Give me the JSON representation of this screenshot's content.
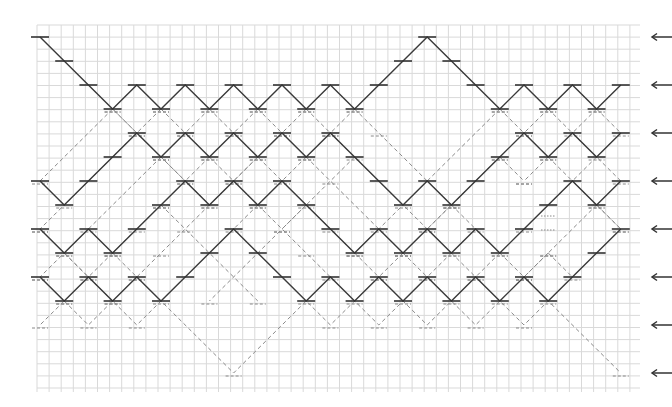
{
  "diagram": {
    "title": "",
    "grid": {
      "x0": 37,
      "y0": 25,
      "x1": 640,
      "y1": 392,
      "cell": 12.1,
      "color": "#d9d9d9"
    },
    "lattice": {
      "col0_x": 40,
      "col_step": 24.2,
      "cols": 25,
      "row0_y": 37,
      "row_step": 24.0,
      "rows": 15
    },
    "colors": {
      "solid": "#3a3a3a",
      "dashed": "#8a8a8a",
      "arrow": "#333333",
      "background": "#ffffff"
    },
    "solid_paths": [
      {
        "name": "path-1",
        "points": [
          [
            0,
            0
          ],
          [
            1,
            1
          ],
          [
            2,
            2
          ],
          [
            3,
            3
          ],
          [
            4,
            2
          ],
          [
            5,
            3
          ],
          [
            6,
            2
          ],
          [
            7,
            3
          ],
          [
            8,
            2
          ],
          [
            9,
            3
          ],
          [
            10,
            2
          ],
          [
            11,
            3
          ],
          [
            12,
            2
          ],
          [
            13,
            3
          ],
          [
            14,
            2
          ],
          [
            15,
            1
          ],
          [
            16,
            0
          ],
          [
            17,
            1
          ],
          [
            18,
            2
          ],
          [
            19,
            3
          ],
          [
            20,
            2
          ],
          [
            21,
            3
          ],
          [
            22,
            2
          ],
          [
            23,
            3
          ],
          [
            24,
            2
          ]
        ]
      },
      {
        "name": "path-2",
        "points": [
          [
            0,
            6
          ],
          [
            1,
            7
          ],
          [
            2,
            6
          ],
          [
            3,
            5
          ],
          [
            4,
            4
          ],
          [
            5,
            5
          ],
          [
            6,
            4
          ],
          [
            7,
            5
          ],
          [
            8,
            4
          ],
          [
            9,
            5
          ],
          [
            10,
            4
          ],
          [
            11,
            5
          ],
          [
            12,
            4
          ],
          [
            13,
            5
          ],
          [
            14,
            6
          ],
          [
            15,
            7
          ],
          [
            16,
            6
          ],
          [
            17,
            7
          ],
          [
            18,
            6
          ],
          [
            19,
            5
          ],
          [
            20,
            4
          ],
          [
            21,
            5
          ],
          [
            22,
            4
          ],
          [
            23,
            5
          ],
          [
            24,
            4
          ]
        ]
      },
      {
        "name": "path-3",
        "points": [
          [
            0,
            8
          ],
          [
            1,
            9
          ],
          [
            2,
            8
          ],
          [
            3,
            9
          ],
          [
            4,
            8
          ],
          [
            5,
            7
          ],
          [
            6,
            6
          ],
          [
            7,
            7
          ],
          [
            8,
            6
          ],
          [
            9,
            7
          ],
          [
            10,
            6
          ],
          [
            11,
            7
          ],
          [
            12,
            8
          ],
          [
            13,
            9
          ],
          [
            14,
            8
          ],
          [
            15,
            9
          ],
          [
            16,
            8
          ],
          [
            17,
            9
          ],
          [
            18,
            8
          ],
          [
            19,
            9
          ],
          [
            20,
            8
          ],
          [
            21,
            7
          ],
          [
            22,
            6
          ],
          [
            23,
            7
          ],
          [
            24,
            6
          ]
        ]
      },
      {
        "name": "path-4",
        "points": [
          [
            0,
            10
          ],
          [
            1,
            11
          ],
          [
            2,
            10
          ],
          [
            3,
            11
          ],
          [
            4,
            10
          ],
          [
            5,
            11
          ],
          [
            6,
            10
          ],
          [
            7,
            9
          ],
          [
            8,
            8
          ],
          [
            9,
            9
          ],
          [
            10,
            10
          ],
          [
            11,
            11
          ],
          [
            12,
            10
          ],
          [
            13,
            11
          ],
          [
            14,
            10
          ],
          [
            15,
            11
          ],
          [
            16,
            10
          ],
          [
            17,
            11
          ],
          [
            18,
            10
          ],
          [
            19,
            11
          ],
          [
            20,
            10
          ],
          [
            21,
            11
          ],
          [
            22,
            10
          ],
          [
            23,
            9
          ],
          [
            24,
            8
          ]
        ]
      }
    ],
    "dashed_paths": [
      {
        "points": [
          [
            0,
            6
          ],
          [
            3,
            3
          ],
          [
            7,
            7
          ],
          [
            9,
            5
          ],
          [
            12,
            8
          ],
          [
            13,
            9
          ]
        ]
      },
      {
        "points": [
          [
            3,
            3
          ],
          [
            4,
            4
          ]
        ]
      },
      {
        "points": [
          [
            5,
            3
          ],
          [
            6,
            4
          ]
        ]
      },
      {
        "points": [
          [
            5,
            3
          ],
          [
            4,
            4
          ],
          [
            1,
            7
          ],
          [
            0,
            8
          ]
        ]
      },
      {
        "points": [
          [
            7,
            3
          ],
          [
            6,
            4
          ]
        ]
      },
      {
        "points": [
          [
            7,
            3
          ],
          [
            8,
            4
          ]
        ]
      },
      {
        "points": [
          [
            9,
            3
          ],
          [
            8,
            4
          ]
        ]
      },
      {
        "points": [
          [
            9,
            3
          ],
          [
            10,
            4
          ]
        ]
      },
      {
        "points": [
          [
            11,
            3
          ],
          [
            10,
            4
          ]
        ]
      },
      {
        "points": [
          [
            11,
            3
          ],
          [
            12,
            4
          ]
        ]
      },
      {
        "points": [
          [
            13,
            3
          ],
          [
            12,
            4
          ]
        ]
      },
      {
        "points": [
          [
            13,
            3
          ],
          [
            14,
            4
          ],
          [
            17,
            7
          ]
        ]
      },
      {
        "points": [
          [
            19,
            3
          ],
          [
            15,
            7
          ],
          [
            13,
            9
          ]
        ]
      },
      {
        "points": [
          [
            19,
            3
          ],
          [
            20,
            4
          ]
        ]
      },
      {
        "points": [
          [
            21,
            3
          ],
          [
            20,
            4
          ]
        ]
      },
      {
        "points": [
          [
            21,
            3
          ],
          [
            24,
            6
          ]
        ]
      },
      {
        "points": [
          [
            23,
            3
          ],
          [
            22,
            4
          ]
        ]
      },
      {
        "points": [
          [
            23,
            3
          ],
          [
            24,
            4
          ]
        ]
      },
      {
        "points": [
          [
            5,
            5
          ],
          [
            2,
            8
          ],
          [
            1,
            9
          ],
          [
            0,
            10
          ]
        ]
      },
      {
        "points": [
          [
            5,
            5
          ],
          [
            6,
            6
          ]
        ]
      },
      {
        "points": [
          [
            7,
            5
          ],
          [
            6,
            6
          ]
        ]
      },
      {
        "points": [
          [
            7,
            5
          ],
          [
            8,
            6
          ]
        ]
      },
      {
        "points": [
          [
            9,
            5
          ],
          [
            8,
            6
          ]
        ]
      },
      {
        "points": [
          [
            11,
            5
          ],
          [
            10,
            6
          ]
        ]
      },
      {
        "points": [
          [
            11,
            5
          ],
          [
            14,
            8
          ]
        ]
      },
      {
        "points": [
          [
            12,
            4
          ],
          [
            16,
            8
          ]
        ]
      },
      {
        "points": [
          [
            13,
            5
          ],
          [
            12,
            6
          ],
          [
            7,
            11
          ]
        ]
      },
      {
        "points": [
          [
            19,
            5
          ],
          [
            15,
            9
          ]
        ]
      },
      {
        "points": [
          [
            19,
            5
          ],
          [
            20,
            6
          ]
        ]
      },
      {
        "points": [
          [
            21,
            5
          ],
          [
            20,
            6
          ]
        ]
      },
      {
        "points": [
          [
            21,
            5
          ],
          [
            24,
            8
          ]
        ]
      },
      {
        "points": [
          [
            23,
            5
          ],
          [
            20,
            8
          ]
        ]
      },
      {
        "points": [
          [
            17,
            7
          ],
          [
            16,
            8
          ]
        ]
      },
      {
        "points": [
          [
            17,
            7
          ],
          [
            18,
            8
          ]
        ]
      },
      {
        "points": [
          [
            23,
            7
          ],
          [
            24,
            8
          ]
        ]
      },
      {
        "points": [
          [
            23,
            7
          ],
          [
            20,
            10
          ]
        ]
      },
      {
        "points": [
          [
            0,
            8
          ],
          [
            3,
            11
          ]
        ]
      },
      {
        "points": [
          [
            1,
            9
          ],
          [
            2,
            10
          ]
        ]
      },
      {
        "points": [
          [
            3,
            9
          ],
          [
            2,
            10
          ]
        ]
      },
      {
        "points": [
          [
            3,
            9
          ],
          [
            4,
            10
          ]
        ]
      },
      {
        "points": [
          [
            5,
            7
          ],
          [
            4,
            8
          ],
          [
            3,
            9
          ]
        ]
      },
      {
        "points": [
          [
            5,
            7
          ],
          [
            9,
            11
          ]
        ]
      },
      {
        "points": [
          [
            7,
            7
          ],
          [
            6,
            8
          ],
          [
            5,
            9
          ],
          [
            4,
            10
          ]
        ]
      },
      {
        "points": [
          [
            9,
            7
          ],
          [
            8,
            8
          ]
        ]
      },
      {
        "points": [
          [
            9,
            7
          ],
          [
            10,
            8
          ],
          [
            11,
            9
          ],
          [
            12,
            10
          ]
        ]
      },
      {
        "points": [
          [
            11,
            7
          ],
          [
            10,
            8
          ]
        ]
      },
      {
        "points": [
          [
            13,
            9
          ],
          [
            14,
            10
          ]
        ]
      },
      {
        "points": [
          [
            15,
            9
          ],
          [
            14,
            10
          ]
        ]
      },
      {
        "points": [
          [
            15,
            9
          ],
          [
            16,
            10
          ]
        ]
      },
      {
        "points": [
          [
            17,
            9
          ],
          [
            16,
            10
          ]
        ]
      },
      {
        "points": [
          [
            17,
            9
          ],
          [
            18,
            10
          ]
        ]
      },
      {
        "points": [
          [
            19,
            9
          ],
          [
            18,
            10
          ]
        ]
      },
      {
        "points": [
          [
            19,
            9
          ],
          [
            20,
            10
          ]
        ]
      },
      {
        "points": [
          [
            21,
            9
          ],
          [
            20,
            10
          ]
        ]
      },
      {
        "points": [
          [
            21,
            9
          ],
          [
            22,
            10
          ]
        ]
      },
      {
        "points": [
          [
            0,
            10
          ],
          [
            1,
            11
          ],
          [
            0,
            12
          ]
        ]
      },
      {
        "points": [
          [
            1,
            11
          ],
          [
            2,
            12
          ],
          [
            3,
            11
          ],
          [
            4,
            12
          ],
          [
            5,
            11
          ],
          [
            8,
            14
          ],
          [
            11,
            11
          ],
          [
            12,
            12
          ],
          [
            13,
            11
          ],
          [
            14,
            12
          ],
          [
            15,
            11
          ],
          [
            16,
            12
          ],
          [
            17,
            11
          ],
          [
            18,
            12
          ],
          [
            19,
            11
          ],
          [
            20,
            12
          ],
          [
            21,
            11
          ],
          [
            24,
            14
          ]
        ]
      }
    ],
    "arrows": [
      {
        "row": 0,
        "label": ""
      },
      {
        "row": 2,
        "label": ""
      },
      {
        "row": 4,
        "label": ""
      },
      {
        "row": 6,
        "label": ""
      },
      {
        "row": 8,
        "label": ""
      },
      {
        "row": 10,
        "label": ""
      },
      {
        "row": 12,
        "label": ""
      },
      {
        "row": 14,
        "label": ""
      }
    ],
    "dotted_marks": [
      {
        "x1": 541,
        "y1": 216,
        "x2": 556,
        "y2": 216
      },
      {
        "x1": 541,
        "y1": 230,
        "x2": 556,
        "y2": 230
      }
    ]
  }
}
